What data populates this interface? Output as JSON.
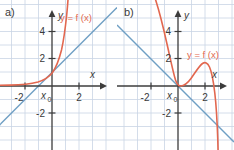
{
  "figure": {
    "background": "#ffffff",
    "grid_color": "#c9d4e4",
    "axis_color": "#3c3c3c",
    "curve_color": "#e2674f",
    "tangent_color": "#6f9fc4",
    "label_color": "#3a3a3a",
    "grid_unit_px": 13.5
  },
  "panels": [
    {
      "id": "a",
      "label": "a)",
      "axes": {
        "x_axis_label": "x",
        "y_axis_label": "y",
        "origin_px": {
          "x": 52,
          "y": 86
        },
        "x_ticks": [
          {
            "value": -2,
            "label": "-2"
          },
          {
            "value": 2,
            "label": "2"
          }
        ],
        "y_ticks": [
          {
            "value": 4,
            "label": "4"
          },
          {
            "value": 2,
            "label": "2"
          },
          {
            "value": -2,
            "label": "-2"
          }
        ],
        "xlim": [
          -3.85,
          4.8
        ],
        "ylim": [
          -4.7,
          6.1
        ]
      },
      "annotations": [
        {
          "name": "function-label",
          "text": "y = f (x)",
          "color": "#e2674f"
        },
        {
          "name": "x0-label",
          "text": "x",
          "subscript": "0",
          "color": "#3a3a3a"
        }
      ],
      "curve": {
        "name": "function-curve",
        "type": "exponential-like",
        "description": "monotonically increasing convex curve, flat near y=0.1 for x<-2, passes near (0,1), rises steeply"
      },
      "tangent": {
        "name": "tangent-line",
        "type": "line",
        "slope": 1.0,
        "x_intercept": -1.0,
        "description": "tangent at x0, crosses x-axis near x=-1, positive slope"
      }
    },
    {
      "id": "b",
      "label": "b)",
      "axes": {
        "x_axis_label": "x",
        "y_axis_label": "y",
        "origin_px": {
          "x": 178,
          "y": 86
        },
        "x_ticks": [
          {
            "value": -2,
            "label": "-2"
          },
          {
            "value": 2,
            "label": "2"
          }
        ],
        "y_ticks": [
          {
            "value": 4,
            "label": "4"
          },
          {
            "value": 2,
            "label": "2"
          },
          {
            "value": -2,
            "label": "-2"
          }
        ],
        "xlim": [
          -4.6,
          4.1
        ],
        "ylim": [
          -4.7,
          6.1
        ]
      },
      "annotations": [
        {
          "name": "function-label",
          "text": "y = f (x)",
          "color": "#e2674f"
        },
        {
          "name": "x0-label",
          "text": "x",
          "subscript": "0",
          "color": "#3a3a3a"
        }
      ],
      "curve": {
        "name": "function-curve",
        "type": "cubic-like",
        "description": "descends steeply from upper left, local minimum at (0,0) touching x-axis, local maximum near (1.7,1.6), plunges steeply after x=2.3",
        "local_min": {
          "x": 0,
          "y": 0
        },
        "local_max": {
          "x": 1.7,
          "y": 1.6
        }
      },
      "tangent": {
        "name": "tangent-line",
        "type": "line",
        "slope": -1.0,
        "description": "tangent at x0 through origin with negative slope"
      }
    }
  ]
}
